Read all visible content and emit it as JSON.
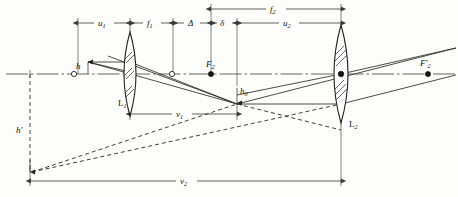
{
  "figure": {
    "type": "optics-ray-diagram",
    "background_color": "#fdfdfb",
    "line_color": "#2a2a2a"
  },
  "labels": {
    "u1": {
      "base": "u",
      "sub": "1"
    },
    "f1": {
      "base": "f",
      "sub": "1"
    },
    "delta_cap": {
      "base": "Δ",
      "sub": ""
    },
    "delta_small": {
      "base": "δ",
      "sub": ""
    },
    "f2": {
      "base": "f",
      "sub": "2"
    },
    "u2": {
      "base": "u",
      "sub": "2"
    },
    "v1": {
      "base": "v",
      "sub": "1"
    },
    "v2": {
      "base": "v",
      "sub": "2"
    },
    "h": {
      "base": "h",
      "sub": ""
    },
    "h_prime": {
      "base": "h′",
      "sub": ""
    },
    "h0": {
      "base": "h",
      "sub": "0"
    },
    "F2": {
      "base": "F",
      "sub": "2"
    },
    "F2_prime": {
      "base": "F′",
      "sub": "2"
    },
    "L1": {
      "base": "L",
      "sub": "1"
    },
    "L2": {
      "base": "L",
      "sub": "2"
    }
  },
  "dimensions": [
    {
      "name": "u1",
      "label": "u₁",
      "row": "top-lower",
      "from_x": 78,
      "to_x": 130,
      "y": 23
    },
    {
      "name": "f1",
      "label": "f₁",
      "row": "top-lower",
      "from_x": 130,
      "to_x": 173,
      "y": 23
    },
    {
      "name": "delta-cap",
      "label": "Δ",
      "row": "top-lower",
      "from_x": 173,
      "to_x": 211,
      "y": 23
    },
    {
      "name": "delta-small",
      "label": "δ",
      "row": "top-lower",
      "from_x": 211,
      "to_x": 237,
      "y": 23
    },
    {
      "name": "u2",
      "label": "u₂",
      "row": "top-lower",
      "from_x": 237,
      "to_x": 341,
      "y": 23
    },
    {
      "name": "f2",
      "label": "f₂",
      "row": "top-upper",
      "from_x": 211,
      "to_x": 341,
      "y": 9
    },
    {
      "name": "v1",
      "label": "v₁",
      "row": "middle",
      "from_x": 130,
      "to_x": 237,
      "y": 114
    },
    {
      "name": "v2",
      "label": "v₂",
      "row": "bottom",
      "from_x": 30,
      "to_x": 341,
      "y": 181
    }
  ],
  "lenses": [
    {
      "name": "L1",
      "label": "L₁",
      "x": 130,
      "half_height": 42,
      "label_x": 118,
      "label_y": 104
    },
    {
      "name": "L2",
      "label": "L₂",
      "x": 341,
      "half_height": 49,
      "label_x": 349,
      "label_y": 124
    }
  ],
  "points": [
    {
      "name": "object-axis-point",
      "label": "",
      "x": 74,
      "y": 74,
      "style": "open"
    },
    {
      "name": "intermediate-image-point",
      "label": "",
      "x": 172,
      "y": 74,
      "style": "open"
    },
    {
      "name": "focal-point-F2",
      "label": "F₂",
      "x": 211,
      "y": 74,
      "style": "solid",
      "label_x": 202,
      "label_y": 68
    },
    {
      "name": "lens2-center",
      "label": "",
      "x": 341,
      "y": 74,
      "style": "solid"
    },
    {
      "name": "focal-point-F2-prime",
      "label": "F′₂",
      "x": 428,
      "y": 74,
      "style": "solid",
      "label_x": 419,
      "label_y": 66
    }
  ],
  "heights": [
    {
      "name": "object-height-h",
      "label": "h",
      "x": 88,
      "y_top": 62,
      "y_axis": 74,
      "label_x": 78,
      "label_y": 70
    },
    {
      "name": "image-height-h-prime",
      "label": "h′",
      "x": 30,
      "y_top": 74,
      "y_bottom": 172,
      "label_x": 17,
      "label_y": 131
    },
    {
      "name": "intermediate-height-h0",
      "label": "h₀",
      "x": 237,
      "y_top": 86,
      "y_axis": 104,
      "label_x": 241,
      "label_y": 94
    }
  ],
  "axis": {
    "name": "optical-axis",
    "y": 74,
    "from_x": 6,
    "to_x": 456,
    "style": "dash-dot"
  },
  "rays": [
    {
      "name": "ray-parallel-upper",
      "kind": "solid"
    },
    {
      "name": "ray-through-center",
      "kind": "solid"
    },
    {
      "name": "ray-lower-out",
      "kind": "solid"
    },
    {
      "name": "ray-virtual-extension-upper",
      "kind": "dashed"
    },
    {
      "name": "ray-virtual-extension-lower",
      "kind": "dashed"
    }
  ]
}
